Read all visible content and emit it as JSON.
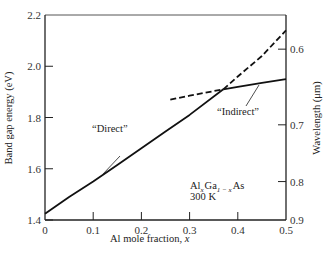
{
  "chart_data": {
    "type": "line",
    "title": "",
    "xlabel": "Al mole fraction, x",
    "ylabel": "Band gap energy (eV)",
    "ylabel_right": "Wavelength (μm)",
    "xlim": [
      0,
      0.5
    ],
    "ylim": [
      1.4,
      2.2
    ],
    "x_ticks": [
      "0",
      "0.1",
      "0.2",
      "0.3",
      "0.4",
      "0.5"
    ],
    "y_ticks": [
      "1.4",
      "1.6",
      "1.8",
      "2.0",
      "2.2"
    ],
    "y_right_ticks": [
      "0.6",
      "0.7",
      "0.8",
      "0.9"
    ],
    "grid": false,
    "legend": "none",
    "series": [
      {
        "name": "Direct",
        "style": "solid",
        "x": [
          0,
          0.05,
          0.1,
          0.15,
          0.2,
          0.25,
          0.3,
          0.37
        ],
        "y": [
          1.424,
          1.49,
          1.55,
          1.615,
          1.68,
          1.745,
          1.81,
          1.91
        ]
      },
      {
        "name": "Direct (extension)",
        "style": "dashed",
        "x": [
          0.37,
          0.4,
          0.45,
          0.5
        ],
        "y": [
          1.91,
          1.96,
          2.04,
          2.14
        ]
      },
      {
        "name": "Indirect (extension)",
        "style": "dashed",
        "x": [
          0.26,
          0.3,
          0.37
        ],
        "y": [
          1.87,
          1.885,
          1.91
        ]
      },
      {
        "name": "Indirect",
        "style": "solid",
        "x": [
          0.37,
          0.4,
          0.45,
          0.5
        ],
        "y": [
          1.91,
          1.92,
          1.935,
          1.95
        ]
      }
    ],
    "annotations": [
      "“Direct”",
      "“Indirect”",
      "Al_x Ga_{1-x} As",
      "300 K"
    ]
  },
  "labels": {
    "xlabel_main": "Al mole fraction, ",
    "xlabel_var": "x",
    "ylabel": "Band gap energy (eV)",
    "ylabel_right": "Wavelength (μm)",
    "direct": "“Direct”",
    "indirect": "“Indirect”",
    "material_al": "Al",
    "material_x": "x",
    "material_ga": "Ga",
    "material_sub": "1 − x",
    "material_as": "As",
    "temperature": "300 K"
  }
}
